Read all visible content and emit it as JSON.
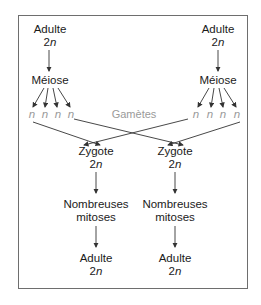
{
  "diagram": {
    "type": "life-cycle-flow",
    "language": "fr",
    "parents": [
      {
        "stage": "Adulte",
        "ploidy_num": "2",
        "ploidy_n": "n",
        "process": "Méiose"
      },
      {
        "stage": "Adulte",
        "ploidy_num": "2",
        "ploidy_n": "n",
        "process": "Méiose"
      }
    ],
    "gamete_symbol": "n",
    "gametes_label": "Gamètes",
    "offspring": [
      {
        "zygote": "Zygote",
        "ploidy_num": "2",
        "ploidy_n": "n",
        "process_line1": "Nombreuses",
        "process_line2": "mitoses",
        "adult": "Adulte",
        "adult_ploidy_num": "2",
        "adult_ploidy_n": "n"
      },
      {
        "zygote": "Zygote",
        "ploidy_num": "2",
        "ploidy_n": "n",
        "process_line1": "Nombreuses",
        "process_line2": "mitoses",
        "adult": "Adulte",
        "adult_ploidy_num": "2",
        "adult_ploidy_n": "n"
      }
    ],
    "colors": {
      "text": "#1a1a1a",
      "gamete": "#9a9a9a",
      "arrow": "#333333",
      "border": "#6e6e6e"
    }
  }
}
